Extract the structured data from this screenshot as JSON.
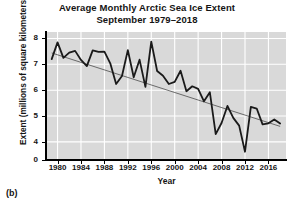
{
  "figure": {
    "panel_label": "(b)",
    "title_line1": "Average Monthly Arctic Sea Ice Extent",
    "title_line2": "September 1979–2018",
    "y_axis_title": "Extent (millions of square kilometers)",
    "x_axis_title": "Year",
    "colors": {
      "plot_background": "#d9d9d9",
      "gridline": "#ffffff",
      "data_line": "#1a1a1a",
      "trend_line": "#3a3a3a",
      "axis": "#000000",
      "text": "#141414",
      "page_background": "#ffffff"
    }
  },
  "chart_data": {
    "type": "line",
    "title": "Average Monthly Arctic Sea Ice Extent September 1979–2018",
    "xlabel": "Year",
    "ylabel": "Extent (millions of square kilometers)",
    "xlim": [
      1978.2,
      2019.0
    ],
    "ylim": [
      3.3,
      8.25
    ],
    "ytick_labels": [
      "0",
      "4",
      "5",
      "6",
      "7",
      "8"
    ],
    "ytick_values": [
      0,
      4,
      5,
      6,
      7,
      8
    ],
    "y_axis_break": true,
    "y_axis_break_between": [
      0,
      4
    ],
    "xtick_labels": [
      "1980",
      "1984",
      "1988",
      "1992",
      "1996",
      "2000",
      "2004",
      "2008",
      "2012",
      "2016"
    ],
    "xtick_values": [
      1980,
      1984,
      1988,
      1992,
      1996,
      2000,
      2004,
      2008,
      2012,
      2016
    ],
    "grid": true,
    "grid_color": "#ffffff",
    "legend": false,
    "series": [
      {
        "name": "September Arctic sea ice extent",
        "x": [
          1979,
          1980,
          1981,
          1982,
          1983,
          1984,
          1985,
          1986,
          1987,
          1988,
          1989,
          1990,
          1991,
          1992,
          1993,
          1994,
          1995,
          1996,
          1997,
          1998,
          1999,
          2000,
          2001,
          2002,
          2003,
          2004,
          2005,
          2006,
          2007,
          2008,
          2009,
          2010,
          2011,
          2012,
          2013,
          2014,
          2015,
          2016,
          2017,
          2018
        ],
        "values": [
          7.2,
          7.85,
          7.25,
          7.45,
          7.52,
          7.17,
          6.93,
          7.54,
          7.48,
          7.49,
          7.04,
          6.24,
          6.55,
          7.55,
          6.5,
          7.18,
          6.13,
          7.88,
          6.74,
          6.56,
          6.24,
          6.32,
          6.75,
          5.96,
          6.15,
          6.05,
          5.57,
          5.92,
          4.3,
          4.73,
          5.39,
          4.93,
          4.63,
          3.62,
          5.35,
          5.29,
          4.68,
          4.72,
          4.87,
          4.71
        ],
        "style": "solid",
        "width": 1.8,
        "color": "#1a1a1a"
      }
    ],
    "trend_line": {
      "name": "linear trend",
      "x": [
        1979,
        2018
      ],
      "values": [
        7.44,
        4.6
      ],
      "style": "solid",
      "width": 0.7,
      "color": "#3a3a3a"
    }
  }
}
